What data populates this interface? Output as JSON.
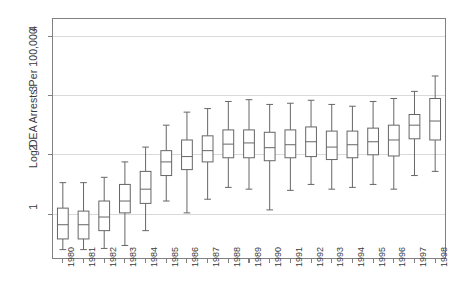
{
  "chart_data": {
    "type": "box",
    "title": "",
    "xlabel": "",
    "ylabel": "Log DEA Arrests Per 100,000",
    "ylim": [
      0.25,
      4.3
    ],
    "yticks": [
      1,
      2,
      3,
      4
    ],
    "ytick_labels": [
      "1",
      "2",
      "3",
      "4"
    ],
    "grid": true,
    "grid_axis": "y",
    "legend": "none",
    "categories": [
      "1980",
      "1981",
      "1982",
      "1983",
      "1984",
      "1985",
      "1986",
      "1987",
      "1988",
      "1989",
      "1990",
      "1991",
      "1992",
      "1993",
      "1994",
      "1995",
      "1996",
      "1997",
      "1998"
    ],
    "box_color": "#ffffff",
    "line_color": "#666666",
    "grid_color": "#d9d9d9",
    "axis_color": "#808080",
    "boxes": [
      {
        "category": "1980",
        "whisker_low": 0.4,
        "q1": 0.58,
        "median": 0.82,
        "q3": 1.1,
        "whisker_high": 1.53
      },
      {
        "category": "1981",
        "whisker_low": 0.4,
        "q1": 0.58,
        "median": 0.82,
        "q3": 1.05,
        "whisker_high": 1.53
      },
      {
        "category": "1982",
        "whisker_low": 0.42,
        "q1": 0.72,
        "median": 0.95,
        "q3": 1.22,
        "whisker_high": 1.62
      },
      {
        "category": "1983",
        "whisker_low": 0.47,
        "q1": 1.02,
        "median": 1.22,
        "q3": 1.5,
        "whisker_high": 1.88
      },
      {
        "category": "1984",
        "whisker_low": 0.72,
        "q1": 1.18,
        "median": 1.42,
        "q3": 1.72,
        "whisker_high": 2.13
      },
      {
        "category": "1985",
        "whisker_low": 1.22,
        "q1": 1.65,
        "median": 1.88,
        "q3": 2.07,
        "whisker_high": 2.5
      },
      {
        "category": "1986",
        "whisker_low": 1.02,
        "q1": 1.75,
        "median": 1.97,
        "q3": 2.25,
        "whisker_high": 2.72
      },
      {
        "category": "1987",
        "whisker_low": 1.25,
        "q1": 1.88,
        "median": 2.07,
        "q3": 2.32,
        "whisker_high": 2.78
      },
      {
        "category": "1988",
        "whisker_low": 1.45,
        "q1": 1.95,
        "median": 2.18,
        "q3": 2.42,
        "whisker_high": 2.9
      },
      {
        "category": "1989",
        "whisker_low": 1.42,
        "q1": 1.95,
        "median": 2.2,
        "q3": 2.42,
        "whisker_high": 2.93
      },
      {
        "category": "1990",
        "whisker_low": 1.07,
        "q1": 1.9,
        "median": 2.12,
        "q3": 2.38,
        "whisker_high": 2.85
      },
      {
        "category": "1991",
        "whisker_low": 1.4,
        "q1": 1.95,
        "median": 2.17,
        "q3": 2.42,
        "whisker_high": 2.87
      },
      {
        "category": "1992",
        "whisker_low": 1.5,
        "q1": 1.97,
        "median": 2.22,
        "q3": 2.47,
        "whisker_high": 2.92
      },
      {
        "category": "1993",
        "whisker_low": 1.42,
        "q1": 1.92,
        "median": 2.13,
        "q3": 2.4,
        "whisker_high": 2.85
      },
      {
        "category": "1994",
        "whisker_low": 1.45,
        "q1": 1.95,
        "median": 2.17,
        "q3": 2.4,
        "whisker_high": 2.82
      },
      {
        "category": "1995",
        "whisker_low": 1.5,
        "q1": 2.0,
        "median": 2.22,
        "q3": 2.45,
        "whisker_high": 2.9
      },
      {
        "category": "1996",
        "whisker_low": 1.42,
        "q1": 1.98,
        "median": 2.25,
        "q3": 2.5,
        "whisker_high": 2.95
      },
      {
        "category": "1997",
        "whisker_low": 1.65,
        "q1": 2.27,
        "median": 2.5,
        "q3": 2.68,
        "whisker_high": 3.07
      },
      {
        "category": "1998",
        "whisker_low": 1.72,
        "q1": 2.25,
        "median": 2.57,
        "q3": 2.95,
        "whisker_high": 3.33
      }
    ]
  }
}
